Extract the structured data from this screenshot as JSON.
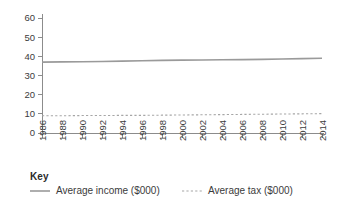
{
  "chart_data": {
    "type": "line",
    "title": "",
    "xlabel": "",
    "ylabel": "",
    "xlim": [
      1986,
      2014
    ],
    "ylim": [
      0,
      60
    ],
    "grid": false,
    "legend_position": "bottom-left",
    "x": [
      1986,
      1988,
      1990,
      1992,
      1994,
      1996,
      1998,
      2000,
      2002,
      2004,
      2006,
      2008,
      2010,
      2012,
      2014
    ],
    "xtick_labels": [
      "1986",
      "1988",
      "1990",
      "1992",
      "1994",
      "1996",
      "1998",
      "2000",
      "2002",
      "2004",
      "2006",
      "2008",
      "2010",
      "2012",
      "2014"
    ],
    "ytick_labels": [
      "0",
      "10",
      "20",
      "30",
      "40",
      "50",
      "60"
    ],
    "ytick_values": [
      0,
      10,
      20,
      30,
      40,
      50,
      60
    ],
    "series": [
      {
        "name": "Average income ($000)",
        "style": "solid",
        "color": "#9a9a9a",
        "values": [
          37.0,
          37.1,
          37.2,
          37.3,
          37.5,
          37.7,
          37.9,
          38.0,
          38.1,
          38.2,
          38.3,
          38.4,
          38.6,
          38.8,
          39.0
        ]
      },
      {
        "name": "Average tax ($000)",
        "style": "dashed",
        "color": "#a6a6a6",
        "values": [
          9.0,
          9.0,
          9.1,
          9.1,
          9.2,
          9.2,
          9.3,
          9.4,
          9.5,
          9.6,
          9.7,
          9.8,
          9.9,
          10.0,
          10.1
        ]
      }
    ]
  },
  "legend": {
    "title": "Key",
    "items": [
      {
        "label": "Average income ($000)",
        "marker": "solid-line-swatch"
      },
      {
        "label": "Average tax ($000)",
        "marker": "dashed-line-swatch"
      }
    ]
  }
}
